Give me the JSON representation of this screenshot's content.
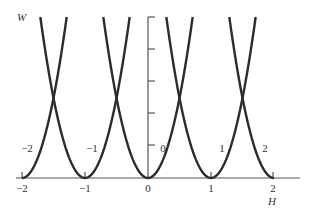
{
  "chart_data": {
    "type": "line",
    "title": "",
    "xlabel": "H",
    "ylabel": "W",
    "xlim": [
      -2.1,
      2.4
    ],
    "ylim": [
      0,
      0.52
    ],
    "x_ticks": [
      -2,
      -1,
      0,
      1,
      2
    ],
    "x_tick_labels": [
      "−2",
      "−1",
      "0",
      "1",
      "2"
    ],
    "y_ticks": [
      0.1,
      0.2,
      0.3,
      0.4,
      0.5
    ],
    "y_tick_labels": [],
    "grid": false,
    "legend": null,
    "series": [
      {
        "name": "−2",
        "center": -2,
        "formula": "W = (H + 2)^2",
        "x": [
          -2,
          -1.85,
          -1.7,
          -1.55,
          -1.4,
          -1.29
        ],
        "y": [
          0,
          0.0225,
          0.09,
          0.2025,
          0.36,
          0.503
        ]
      },
      {
        "name": "−1",
        "center": -1,
        "formula": "W = (H + 1)^2",
        "x": [
          -1.71,
          -1.5,
          -1.25,
          -1,
          -0.75,
          -0.5,
          -0.29
        ],
        "y": [
          0.503,
          0.25,
          0.0625,
          0,
          0.0625,
          0.25,
          0.503
        ]
      },
      {
        "name": "0",
        "center": 0,
        "formula": "W = H^2",
        "x": [
          -0.71,
          -0.5,
          -0.25,
          0,
          0.25,
          0.5,
          0.71
        ],
        "y": [
          0.503,
          0.25,
          0.0625,
          0,
          0.0625,
          0.25,
          0.503
        ]
      },
      {
        "name": "1",
        "center": 1,
        "formula": "W = (H - 1)^2",
        "x": [
          0.29,
          0.5,
          0.75,
          1,
          1.25,
          1.5,
          1.71
        ],
        "y": [
          0.503,
          0.25,
          0.0625,
          0,
          0.0625,
          0.25,
          0.503
        ]
      },
      {
        "name": "2",
        "center": 2,
        "formula": "W = (H - 2)^2",
        "x": [
          1.29,
          1.5,
          1.75,
          2
        ],
        "y": [
          0.503,
          0.25,
          0.0625,
          0
        ]
      }
    ],
    "annotations": [
      {
        "text": "−2",
        "near_series": "−2"
      },
      {
        "text": "−1",
        "near_series": "−1"
      },
      {
        "text": "0",
        "near_series": "0"
      },
      {
        "text": "1",
        "near_series": "1"
      },
      {
        "text": "2",
        "near_series": "2"
      }
    ]
  },
  "labels": {
    "y_axis": "W",
    "x_axis": "H",
    "x_ticks": [
      "−2",
      "−1",
      "0",
      "1",
      "2"
    ],
    "curves": [
      "−2",
      "−1",
      "0",
      "1",
      "2"
    ]
  }
}
